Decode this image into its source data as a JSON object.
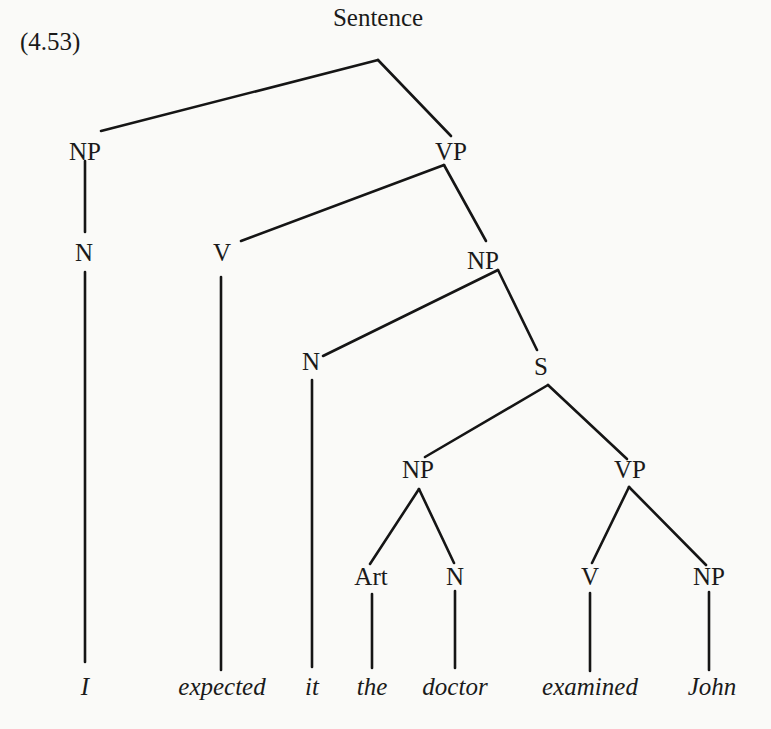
{
  "example_number": "(4.53)",
  "tree": {
    "root": "Sentence",
    "nodes": [
      {
        "id": "s",
        "label": "Sentence",
        "x": 378,
        "y": 4
      },
      {
        "id": "np1",
        "label": "NP",
        "x": 85,
        "y": 138
      },
      {
        "id": "vp1",
        "label": "VP",
        "x": 451,
        "y": 138
      },
      {
        "id": "n1",
        "label": "N",
        "x": 84,
        "y": 239
      },
      {
        "id": "v1",
        "label": "V",
        "x": 222,
        "y": 239
      },
      {
        "id": "np2",
        "label": "NP",
        "x": 483,
        "y": 247
      },
      {
        "id": "n2",
        "label": "N",
        "x": 311,
        "y": 348
      },
      {
        "id": "s2",
        "label": "S",
        "x": 541,
        "y": 353
      },
      {
        "id": "np3",
        "label": "NP",
        "x": 418,
        "y": 456
      },
      {
        "id": "vp2",
        "label": "VP",
        "x": 630,
        "y": 456
      },
      {
        "id": "art",
        "label": "Art",
        "x": 371,
        "y": 563
      },
      {
        "id": "n3",
        "label": "N",
        "x": 455,
        "y": 563
      },
      {
        "id": "v2",
        "label": "V",
        "x": 590,
        "y": 563
      },
      {
        "id": "np4",
        "label": "NP",
        "x": 709,
        "y": 563
      }
    ],
    "words": [
      {
        "text": "I",
        "x": 85
      },
      {
        "text": "expected",
        "x": 222
      },
      {
        "text": "it",
        "x": 312
      },
      {
        "text": "the",
        "x": 372
      },
      {
        "text": "doctor",
        "x": 455
      },
      {
        "text": "examined",
        "x": 590
      },
      {
        "text": "John",
        "x": 712
      }
    ],
    "edges": [
      [
        "Sentence",
        "NP"
      ],
      [
        "Sentence",
        "VP"
      ],
      [
        "NP",
        "N"
      ],
      [
        "N",
        "I"
      ],
      [
        "VP",
        "V"
      ],
      [
        "V",
        "expected"
      ],
      [
        "VP",
        "NP"
      ],
      [
        "NP",
        "N"
      ],
      [
        "N",
        "it"
      ],
      [
        "NP",
        "S"
      ],
      [
        "S",
        "NP"
      ],
      [
        "S",
        "VP"
      ],
      [
        "NP",
        "Art"
      ],
      [
        "Art",
        "the"
      ],
      [
        "NP",
        "N"
      ],
      [
        "N",
        "doctor"
      ],
      [
        "VP",
        "V"
      ],
      [
        "V",
        "examined"
      ],
      [
        "VP",
        "NP"
      ],
      [
        "NP",
        "John"
      ]
    ]
  }
}
